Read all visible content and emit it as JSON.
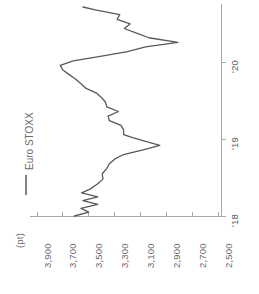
{
  "chart_data": {
    "type": "line",
    "title": "",
    "subtitle": "",
    "orientation": "rotated-90-ccw",
    "legend": {
      "position": "left",
      "entries": [
        {
          "name": "Euro STOXX",
          "color": "#595959",
          "marker": "line"
        }
      ]
    },
    "value_axis": {
      "label": "(pt)",
      "unit": "pt",
      "ticks": [
        3900,
        3700,
        3500,
        3300,
        3100,
        2900,
        2700,
        2500
      ],
      "tick_labels": [
        "3,900",
        "3,700",
        "3,500",
        "3,300",
        "3,100",
        "2,900",
        "2,700",
        "2,500"
      ],
      "min": 2500,
      "max": 3900,
      "grid": false,
      "direction": "descending-left-to-right"
    },
    "time_axis": {
      "label": "",
      "ticks": [
        "'18",
        "'19",
        "'20"
      ],
      "tick_values": [
        2018.0,
        2019.0,
        2020.0
      ],
      "min": 2018.0,
      "max": 2020.72,
      "grid": false
    },
    "series": [
      {
        "name": "Euro STOXX",
        "color": "#595959",
        "x": [
          2018.0,
          2018.05,
          2018.1,
          2018.15,
          2018.2,
          2018.25,
          2018.3,
          2018.35,
          2018.42,
          2018.48,
          2018.55,
          2018.62,
          2018.68,
          2018.74,
          2018.8,
          2018.86,
          2018.92,
          2018.97,
          2019.02,
          2019.06,
          2019.12,
          2019.18,
          2019.24,
          2019.3,
          2019.36,
          2019.42,
          2019.48,
          2019.54,
          2019.6,
          2019.66,
          2019.72,
          2019.78,
          2019.84,
          2019.9,
          2019.96,
          2020.02,
          2020.08,
          2020.14,
          2020.2,
          2020.26,
          2020.32,
          2020.38,
          2020.44,
          2020.5,
          2020.56,
          2020.62,
          2020.68,
          2020.72
        ],
        "y": [
          3610,
          3500,
          3560,
          3430,
          3545,
          3430,
          3555,
          3490,
          3430,
          3390,
          3395,
          3360,
          3340,
          3300,
          3230,
          3080,
          2950,
          3060,
          3160,
          3230,
          3230,
          3250,
          3340,
          3350,
          3270,
          3360,
          3370,
          3400,
          3440,
          3520,
          3560,
          3600,
          3650,
          3700,
          3720,
          3620,
          3400,
          3200,
          3060,
          2810,
          3035,
          3130,
          3225,
          3180,
          3280,
          3260,
          3440,
          3545
        ]
      }
    ]
  },
  "legend": {
    "euro_stoxx_label": "Euro STOXX"
  },
  "axis": {
    "unit_label": "(pt)",
    "value_ticks": [
      "3,900",
      "3,700",
      "3,500",
      "3,300",
      "3,100",
      "2,900",
      "2,700",
      "2,500"
    ],
    "time_ticks": [
      "'18",
      "'19",
      "'20"
    ]
  }
}
